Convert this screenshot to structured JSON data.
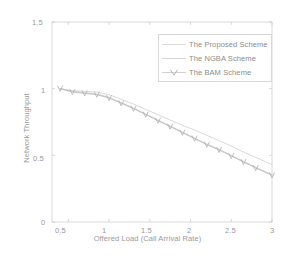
{
  "chart_data": {
    "type": "line",
    "title": "",
    "xlabel": "Offered Load (Call Arrival Rate)",
    "ylabel": "Network Throughput",
    "xlim": [
      0.3,
      3.0
    ],
    "ylim": [
      0.0,
      1.5
    ],
    "xticks": [
      "0.5",
      "1",
      "1.5",
      "2",
      "2.5",
      "3"
    ],
    "xtick_values": [
      0.5,
      1,
      1.5,
      2,
      2.5,
      3
    ],
    "yticks": [
      "0",
      "0.5",
      "1",
      "1.5"
    ],
    "ytick_values": [
      0,
      0.5,
      1,
      1.5
    ],
    "grid": false,
    "legend_position": "upper right",
    "x": [
      0.4,
      0.55,
      0.7,
      0.85,
      1.0,
      1.15,
      1.3,
      1.45,
      1.6,
      1.75,
      1.9,
      2.05,
      2.2,
      2.35,
      2.5,
      2.65,
      2.8,
      3.0
    ],
    "series": [
      {
        "name": "The Proposed Scheme",
        "marker": "none",
        "values": [
          1.0,
          0.985,
          0.98,
          0.975,
          0.955,
          0.92,
          0.885,
          0.845,
          0.805,
          0.765,
          0.725,
          0.69,
          0.65,
          0.61,
          0.57,
          0.525,
          0.485,
          0.43
        ]
      },
      {
        "name": "The NGBA Scheme",
        "marker": "none",
        "values": [
          1.0,
          0.98,
          0.97,
          0.96,
          0.935,
          0.895,
          0.855,
          0.81,
          0.765,
          0.72,
          0.675,
          0.63,
          0.585,
          0.545,
          0.5,
          0.455,
          0.41,
          0.355
        ]
      },
      {
        "name": "The BAM Scheme",
        "marker": "v",
        "values": [
          1.0,
          0.975,
          0.965,
          0.955,
          0.93,
          0.89,
          0.85,
          0.805,
          0.76,
          0.715,
          0.67,
          0.625,
          0.58,
          0.54,
          0.495,
          0.45,
          0.405,
          0.35
        ]
      }
    ]
  },
  "legend": {
    "items": [
      {
        "label": "The Proposed Scheme"
      },
      {
        "label": "The NGBA Scheme"
      },
      {
        "label": "The BAM Scheme"
      }
    ]
  },
  "colors": {
    "axis": "#c9c9c9",
    "text": "#9a9a9a",
    "series_1": "#cfcfcf",
    "series_2": "#c4c4c4",
    "series_3": "#b8b8b8",
    "legend_border": "#d8d8d8",
    "background": "#ffffff"
  }
}
